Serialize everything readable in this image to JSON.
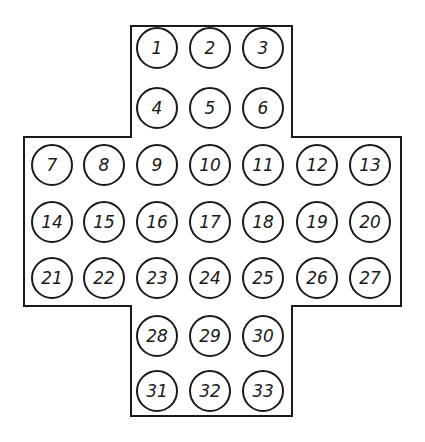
{
  "diagram": {
    "type": "peg-solitaire-board",
    "shape": "english-cross",
    "colors": {
      "line": "#1a1a1a",
      "background": "#ffffff",
      "hole_fill": "#ffffff"
    },
    "outline": [
      [
        131,
        26
      ],
      [
        292,
        26
      ],
      [
        292,
        137
      ],
      [
        401,
        137
      ],
      [
        401,
        306
      ],
      [
        292,
        306
      ],
      [
        292,
        416
      ],
      [
        131,
        416
      ],
      [
        131,
        306
      ],
      [
        24,
        306
      ],
      [
        24,
        137
      ],
      [
        131,
        137
      ]
    ],
    "hole_radius": 20,
    "columns_x": [
      52,
      104,
      157,
      210,
      263,
      317,
      370
    ],
    "rows_y": [
      48,
      108,
      165,
      222,
      278,
      336,
      391
    ],
    "holes": [
      {
        "label": "1",
        "col": 2,
        "row": 0
      },
      {
        "label": "2",
        "col": 3,
        "row": 0
      },
      {
        "label": "3",
        "col": 4,
        "row": 0
      },
      {
        "label": "4",
        "col": 2,
        "row": 1
      },
      {
        "label": "5",
        "col": 3,
        "row": 1
      },
      {
        "label": "6",
        "col": 4,
        "row": 1
      },
      {
        "label": "7",
        "col": 0,
        "row": 2
      },
      {
        "label": "8",
        "col": 1,
        "row": 2
      },
      {
        "label": "9",
        "col": 2,
        "row": 2
      },
      {
        "label": "10",
        "col": 3,
        "row": 2
      },
      {
        "label": "11",
        "col": 4,
        "row": 2
      },
      {
        "label": "12",
        "col": 5,
        "row": 2
      },
      {
        "label": "13",
        "col": 6,
        "row": 2
      },
      {
        "label": "14",
        "col": 0,
        "row": 3
      },
      {
        "label": "15",
        "col": 1,
        "row": 3
      },
      {
        "label": "16",
        "col": 2,
        "row": 3
      },
      {
        "label": "17",
        "col": 3,
        "row": 3
      },
      {
        "label": "18",
        "col": 4,
        "row": 3
      },
      {
        "label": "19",
        "col": 5,
        "row": 3
      },
      {
        "label": "20",
        "col": 6,
        "row": 3
      },
      {
        "label": "21",
        "col": 0,
        "row": 4
      },
      {
        "label": "22",
        "col": 1,
        "row": 4
      },
      {
        "label": "23",
        "col": 2,
        "row": 4
      },
      {
        "label": "24",
        "col": 3,
        "row": 4
      },
      {
        "label": "25",
        "col": 4,
        "row": 4
      },
      {
        "label": "26",
        "col": 5,
        "row": 4
      },
      {
        "label": "27",
        "col": 6,
        "row": 4
      },
      {
        "label": "28",
        "col": 2,
        "row": 5
      },
      {
        "label": "29",
        "col": 3,
        "row": 5
      },
      {
        "label": "30",
        "col": 4,
        "row": 5
      },
      {
        "label": "31",
        "col": 2,
        "row": 6
      },
      {
        "label": "32",
        "col": 3,
        "row": 6
      },
      {
        "label": "33",
        "col": 4,
        "row": 6
      }
    ]
  }
}
